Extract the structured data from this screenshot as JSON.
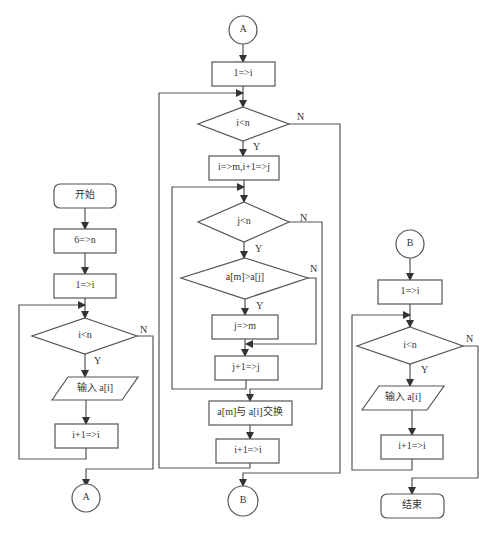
{
  "flowchart_1": {
    "start": "开始",
    "step1": "6=>n",
    "step2": "1=>i",
    "cond": "i<n",
    "yes": "Y",
    "no": "N",
    "input": "输入 a[i]",
    "incr": "i+1=>i",
    "connector_out": "A"
  },
  "flowchart_2": {
    "connector_in": "A",
    "step1": "1=>i",
    "cond_outer": "i<n",
    "yes": "Y",
    "no": "N",
    "step2": "i=>m,i+1=>j",
    "cond_inner": "j<n",
    "cond_compare": "a[m]>a[j]",
    "assign": "j=>m",
    "incr_j": "j+1=>j",
    "swap": "a[m]与 a[i]交换",
    "incr_i": "i+1=>i",
    "connector_out": "B"
  },
  "flowchart_3": {
    "connector_in": "B",
    "step1": "1=>i",
    "cond": "i<n",
    "yes": "Y",
    "no": "N",
    "output": "输入 a[i]",
    "incr": "i+1=>i",
    "end": "结束"
  }
}
